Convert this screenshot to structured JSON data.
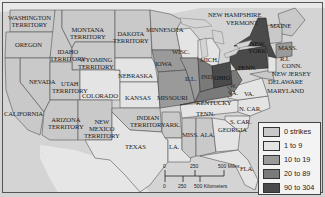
{
  "map": {
    "title": "",
    "subject": "strikes by state",
    "labels": {
      "washington": "WASHINGTON\nTERRITORY",
      "oregon": "OREGON",
      "idaho": "IDAHO\nTERRITORY",
      "montana": "MONTANA\nTERRITORY",
      "wyoming": "WYOMING\nTERRITORY",
      "dakota": "DAKOTA\nTERRITORY",
      "minnesota": "MINNESOTA",
      "wisc": "WISC.",
      "mich": "MICH.",
      "new_hampshire": "NEW HAMPSHIRE",
      "vermont": "VERMONT",
      "maine": "MAINE",
      "new_york": "NEW\nYORK",
      "mass": "MASS.",
      "ri": "R.I.",
      "conn": "CONN.",
      "new_jersey": "NEW JERSEY",
      "delaware": "DELAWARE",
      "maryland": "MARYLAND",
      "penn": "PENN.",
      "ohio": "OHIO",
      "ind": "IND.",
      "ill": "ILL.",
      "iowa": "IOWA",
      "nebraska": "NEBRASKA",
      "nevada": "NEVADA",
      "utah": "UTAH\nTERRITORY",
      "colorado": "COLORADO",
      "kansas": "KANSAS",
      "missouri": "MISSOURI",
      "kentucky": "KENTUCKY",
      "wva": "W.\nVA.",
      "va": "VA.",
      "n_car": "N. CAR.",
      "s_car": "S. CAR.",
      "tenn": "TENN.",
      "georgia": "GEORGIA",
      "california": "CALIFORNIA",
      "arizona": "ARIZONA\nTERRITORY",
      "new_mexico": "NEW\nMEXICO\nTERRITORY",
      "indian": "INDIAN\nTERRITORY",
      "ark": "ARK.",
      "miss": "MISS.",
      "ala": "ALA.",
      "la": "LA.",
      "texas": "TEXAS",
      "fla": "FLA."
    }
  },
  "legend": {
    "items": [
      {
        "label": "0 strikes",
        "color": "#c9c9c9"
      },
      {
        "label": "1 to 9",
        "color": "#e4e4e4"
      },
      {
        "label": "10 to 19",
        "color": "#9a9a9a"
      },
      {
        "label": "20 to 89",
        "color": "#7a7a7a"
      },
      {
        "label": "90 to 304",
        "color": "#4a4a4a"
      }
    ]
  },
  "scale_bar": {
    "miles_ticks": [
      "0",
      "250",
      "500 Miles"
    ],
    "km_ticks": [
      "0",
      "250",
      "500 Kilometers"
    ]
  },
  "colors": {
    "ocean": "#d6d6d6",
    "foreign_land": "#e6e6e6",
    "zero": "#c9c9c9",
    "low": "#e4e4e4",
    "mid": "#9a9a9a",
    "high": "#7a7a7a",
    "top": "#4a4a4a"
  }
}
